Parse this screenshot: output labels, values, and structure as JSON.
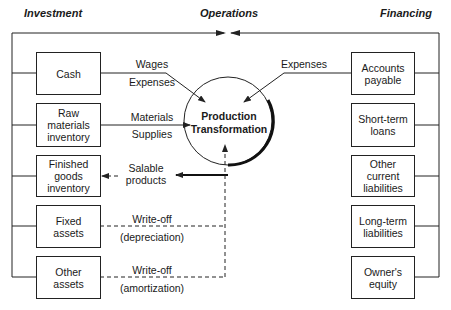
{
  "headers": {
    "investment": "Investment",
    "operations": "Operations",
    "financing": "Financing"
  },
  "center": {
    "label": "Production\nTransformation"
  },
  "investment_boxes": [
    {
      "label": "Cash"
    },
    {
      "label": "Raw\nmaterials\ninventory"
    },
    {
      "label": "Finished\ngoods\ninventory"
    },
    {
      "label": "Fixed\nassets"
    },
    {
      "label": "Other\nassets"
    }
  ],
  "financing_boxes": [
    {
      "label": "Accounts\npayable"
    },
    {
      "label": "Short-term\nloans"
    },
    {
      "label": "Other\ncurrent\nliabilities"
    },
    {
      "label": "Long-term\nliabilities"
    },
    {
      "label": "Owner's\nequity"
    }
  ],
  "flows": {
    "wages": "Wages",
    "expenses_left": "Expenses",
    "materials": "Materials",
    "supplies": "Supplies",
    "salable_products": "Salable\nproducts",
    "writeoff_1": "Write-off",
    "depreciation": "(depreciation)",
    "writeoff_2": "Write-off",
    "amortization": "(amortization)",
    "expenses_right": "Expenses"
  },
  "colors": {
    "line": "#222222",
    "background": "#ffffff"
  }
}
